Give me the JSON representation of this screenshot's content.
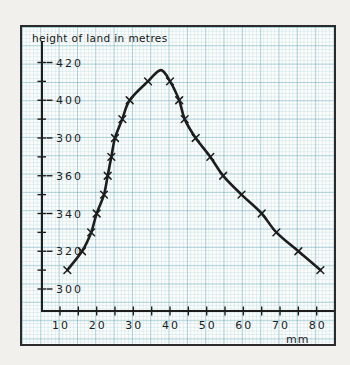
{
  "title": "height of land in metres",
  "colors": {
    "ink": "#1d1d1d",
    "paper": "#fcfcfa",
    "grid_fine": "#cfe5ec",
    "grid_bold": "#a2cdd8",
    "page_margin": "#f1f0ec"
  },
  "chart_data": {
    "type": "line",
    "title": "height of land in metres",
    "xlabel": "mm",
    "ylabel": "height of land in metres",
    "xlim": [
      5,
      85
    ],
    "ylim": [
      290,
      430
    ],
    "grid": "graph-paper",
    "legend": "none",
    "x_ticks": [
      10,
      20,
      30,
      40,
      50,
      60,
      70,
      80
    ],
    "x_minor_step": 5,
    "x_minor_max": 85,
    "y_ticks": [
      {
        "value": 420,
        "label": "420"
      },
      {
        "value": 400,
        "label": "400"
      },
      {
        "value": 380,
        "label": "300"
      },
      {
        "value": 360,
        "label": "360"
      },
      {
        "value": 340,
        "label": "340"
      },
      {
        "value": 320,
        "label": "320"
      },
      {
        "value": 300,
        "label": "300"
      }
    ],
    "y_minor_step": 10,
    "points": [
      {
        "mm": 12,
        "m": 310,
        "mark": true
      },
      {
        "mm": 16,
        "m": 320,
        "mark": true
      },
      {
        "mm": 18.5,
        "m": 330,
        "mark": true
      },
      {
        "mm": 20,
        "m": 340,
        "mark": true
      },
      {
        "mm": 22,
        "m": 350,
        "mark": true
      },
      {
        "mm": 23,
        "m": 360,
        "mark": true
      },
      {
        "mm": 24,
        "m": 370,
        "mark": true
      },
      {
        "mm": 25,
        "m": 380,
        "mark": true
      },
      {
        "mm": 27,
        "m": 390,
        "mark": true
      },
      {
        "mm": 29,
        "m": 400,
        "mark": true
      },
      {
        "mm": 34,
        "m": 410,
        "mark": true
      },
      {
        "mm": 37.5,
        "m": 416,
        "mark": false
      },
      {
        "mm": 40,
        "m": 410,
        "mark": true
      },
      {
        "mm": 42.5,
        "m": 400,
        "mark": true
      },
      {
        "mm": 44,
        "m": 390,
        "mark": true
      },
      {
        "mm": 47,
        "m": 380,
        "mark": true
      },
      {
        "mm": 51,
        "m": 370,
        "mark": true
      },
      {
        "mm": 54.5,
        "m": 360,
        "mark": true
      },
      {
        "mm": 59.5,
        "m": 350,
        "mark": true
      },
      {
        "mm": 65,
        "m": 340,
        "mark": true
      },
      {
        "mm": 69,
        "m": 330,
        "mark": true
      },
      {
        "mm": 75,
        "m": 320,
        "mark": true
      },
      {
        "mm": 81,
        "m": 310,
        "mark": true
      }
    ]
  }
}
